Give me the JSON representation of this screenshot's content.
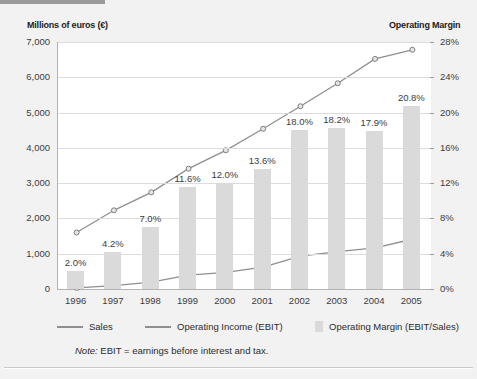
{
  "axis_titles": {
    "left": "Millions of euros (€)",
    "right": "Operating Margin"
  },
  "note": {
    "prefix": "Note:",
    "text": "EBIT = earnings before interest and tax."
  },
  "legend": {
    "items": [
      {
        "label": "Sales",
        "marker": "line",
        "color": "#8f8f8f"
      },
      {
        "label": "Operating Income (EBIT)",
        "marker": "line",
        "color": "#8f8f8f"
      },
      {
        "label": "Operating Margin (EBIT/Sales)",
        "marker": "swatch",
        "color": "#dadada"
      }
    ]
  },
  "chart_data": {
    "type": "line",
    "title": "",
    "subtitle": "",
    "xlabel": "",
    "ylabel": "Millions of euros (€)",
    "y2label": "Operating Margin",
    "grid": true,
    "legend_position": "bottom",
    "categories": [
      "1996",
      "1997",
      "1998",
      "1999",
      "2000",
      "2001",
      "2002",
      "2003",
      "2004",
      "2005"
    ],
    "ylim": [
      0,
      7000
    ],
    "yticks": [
      "0",
      "1,000",
      "2,000",
      "3,000",
      "4,000",
      "5,000",
      "6,000",
      "7,000"
    ],
    "ytick_values": [
      0,
      1000,
      2000,
      3000,
      4000,
      5000,
      6000,
      7000
    ],
    "y2lim": [
      0,
      28
    ],
    "y2ticks": [
      "0%",
      "4%",
      "8%",
      "12%",
      "16%",
      "20%",
      "24%",
      "28%"
    ],
    "y2tick_values": [
      0,
      4,
      8,
      12,
      16,
      20,
      24,
      28
    ],
    "series": [
      {
        "name": "Sales",
        "type": "line",
        "axis": "left",
        "color": "#8f8f8f",
        "values": [
          1600,
          2230,
          2740,
          3410,
          3930,
          4540,
          5180,
          5830,
          6520,
          6780
        ]
      },
      {
        "name": "Operating Income (EBIT)",
        "type": "line",
        "axis": "left",
        "color": "#8f8f8f",
        "values": [
          32,
          94,
          192,
          396,
          472,
          617,
          932,
          1061,
          1167,
          1410
        ]
      },
      {
        "name": "Operating Margin (EBIT/Sales)",
        "type": "bar",
        "axis": "right",
        "color": "#dadada",
        "values": [
          2.0,
          4.2,
          7.0,
          11.6,
          12.0,
          13.6,
          18.0,
          18.2,
          17.9,
          20.8
        ],
        "data_labels": [
          "2.0%",
          "4.2%",
          "7.0%",
          "11.6%",
          "12.0%",
          "13.6%",
          "18.0%",
          "18.2%",
          "17.9%",
          "20.8%"
        ]
      }
    ]
  }
}
